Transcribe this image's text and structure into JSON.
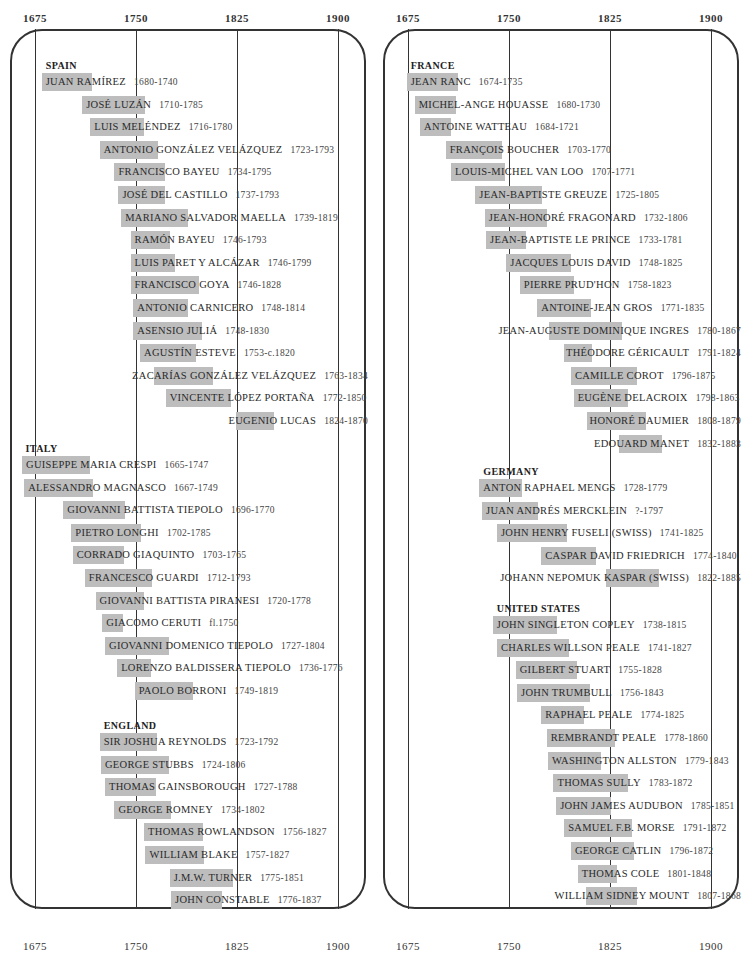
{
  "axis": {
    "ticks": [
      1675,
      1750,
      1825,
      1900
    ]
  },
  "colors": {
    "bar": "#bdbdbd",
    "frame": "#333333",
    "text": "#2a2a2a"
  },
  "chart_data": {
    "type": "timeline",
    "title": "",
    "xlabel": "Year",
    "xlim": [
      1675,
      1900
    ],
    "xticks": [
      1675,
      1750,
      1825,
      1900
    ],
    "grid": true,
    "panels": [
      {
        "groups": [
          {
            "country": "SPAIN",
            "artists": [
              {
                "name": "JUAN RAMÍREZ",
                "dates": "1680-1740",
                "start": 1680,
                "end": 1740
              },
              {
                "name": "JOSÉ LUZÁN",
                "dates": "1710-1785",
                "start": 1710,
                "end": 1785
              },
              {
                "name": "LUIS MELÉNDEZ",
                "dates": "1716-1780",
                "start": 1716,
                "end": 1780
              },
              {
                "name": "ANTONIO GONZÁLEZ VELÁZQUEZ",
                "dates": "1723-1793",
                "start": 1723,
                "end": 1793
              },
              {
                "name": "FRANCISCO BAYEU",
                "dates": "1734-1795",
                "start": 1734,
                "end": 1795
              },
              {
                "name": "JOSÉ DEL CASTILLO",
                "dates": "1737-1793",
                "start": 1737,
                "end": 1793
              },
              {
                "name": "MARIANO SALVADOR MAELLA",
                "dates": "1739-1819",
                "start": 1739,
                "end": 1819
              },
              {
                "name": "RAMÓN BAYEU",
                "dates": "1746-1793",
                "start": 1746,
                "end": 1793
              },
              {
                "name": "LUIS PARET Y ALCÁZAR",
                "dates": "1746-1799",
                "start": 1746,
                "end": 1799
              },
              {
                "name": "FRANCISCO GOYA",
                "dates": "1746-1828",
                "start": 1746,
                "end": 1828
              },
              {
                "name": "ANTONIO CARNICERO",
                "dates": "1748-1814",
                "start": 1748,
                "end": 1814
              },
              {
                "name": "ASENSIO JULIÁ",
                "dates": "1748-1830",
                "start": 1748,
                "end": 1830
              },
              {
                "name": "AGUSTÍN ESTEVE",
                "dates": "1753-c.1820",
                "start": 1753,
                "end": 1820
              },
              {
                "name": "ZACARÍAS GONZÁLEZ VELÁZQUEZ",
                "dates": "1763-1834",
                "start": 1763,
                "end": 1834
              },
              {
                "name": "VINCENTE LÓPEZ PORTAÑA",
                "dates": "1772-1850",
                "start": 1772,
                "end": 1850
              },
              {
                "name": "EUGENIO LUCAS",
                "dates": "1824-1870",
                "start": 1824,
                "end": 1870
              }
            ]
          },
          {
            "country": "ITALY",
            "artists": [
              {
                "name": "GUISEPPE MARIA CRESPI",
                "dates": "1665-1747",
                "start": 1665,
                "end": 1747
              },
              {
                "name": "ALESSANDRO MAGNASCO",
                "dates": "1667-1749",
                "start": 1667,
                "end": 1749
              },
              {
                "name": "GIOVANNI BATTISTA TIEPOLO",
                "dates": "1696-1770",
                "start": 1696,
                "end": 1770
              },
              {
                "name": "PIETRO LONGHI",
                "dates": "1702-1785",
                "start": 1702,
                "end": 1785
              },
              {
                "name": "CORRADO GIAQUINTO",
                "dates": "1703-1765",
                "start": 1703,
                "end": 1765
              },
              {
                "name": "FRANCESCO GUARDI",
                "dates": "1712-1793",
                "start": 1712,
                "end": 1793
              },
              {
                "name": "GIOVANNI BATTISTA PIRANESI",
                "dates": "1720-1778",
                "start": 1720,
                "end": 1778
              },
              {
                "name": "GIACOMO CERUTI",
                "dates": "fl.1750",
                "start": 1725,
                "end": 1750
              },
              {
                "name": "GIOVANNI DOMENICO TIEPOLO",
                "dates": "1727-1804",
                "start": 1727,
                "end": 1804
              },
              {
                "name": "LORENZO BALDISSERA TIEPOLO",
                "dates": "1736-1776",
                "start": 1736,
                "end": 1776
              },
              {
                "name": "PAOLO BORRONI",
                "dates": "1749-1819",
                "start": 1749,
                "end": 1819
              }
            ]
          },
          {
            "country": "ENGLAND",
            "artists": [
              {
                "name": "SIR JOSHUA REYNOLDS",
                "dates": "1723-1792",
                "start": 1723,
                "end": 1792
              },
              {
                "name": "GEORGE STUBBS",
                "dates": "1724-1806",
                "start": 1724,
                "end": 1806
              },
              {
                "name": "THOMAS GAINSBOROUGH",
                "dates": "1727-1788",
                "start": 1727,
                "end": 1788
              },
              {
                "name": "GEORGE ROMNEY",
                "dates": "1734-1802",
                "start": 1734,
                "end": 1802
              },
              {
                "name": "THOMAS ROWLANDSON",
                "dates": "1756-1827",
                "start": 1756,
                "end": 1827
              },
              {
                "name": "WILLIAM BLAKE",
                "dates": "1757-1827",
                "start": 1757,
                "end": 1827
              },
              {
                "name": "J.M.W. TURNER",
                "dates": "1775-1851",
                "start": 1775,
                "end": 1851
              },
              {
                "name": "JOHN CONSTABLE",
                "dates": "1776-1837",
                "start": 1776,
                "end": 1837
              }
            ]
          }
        ]
      },
      {
        "groups": [
          {
            "country": "FRANCE",
            "artists": [
              {
                "name": "JEAN RANC",
                "dates": "1674-1735",
                "start": 1674,
                "end": 1735
              },
              {
                "name": "MICHEL-ANGE HOUASSE",
                "dates": "1680-1730",
                "start": 1680,
                "end": 1730
              },
              {
                "name": "ANTOINE WATTEAU",
                "dates": "1684-1721",
                "start": 1684,
                "end": 1721
              },
              {
                "name": "FRANÇOIS BOUCHER",
                "dates": "1703-1770",
                "start": 1703,
                "end": 1770
              },
              {
                "name": "LOUIS-MICHEL VAN LOO",
                "dates": "1707-1771",
                "start": 1707,
                "end": 1771
              },
              {
                "name": "JEAN-BAPTISTE GREUZE",
                "dates": "1725-1805",
                "start": 1725,
                "end": 1805
              },
              {
                "name": "JEAN-HONORÉ FRAGONARD",
                "dates": "1732-1806",
                "start": 1732,
                "end": 1806
              },
              {
                "name": "JEAN-BAPTISTE LE PRINCE",
                "dates": "1733-1781",
                "start": 1733,
                "end": 1781
              },
              {
                "name": "JACQUES LOUIS DAVID",
                "dates": "1748-1825",
                "start": 1748,
                "end": 1825
              },
              {
                "name": "PIERRE PRUD'HON",
                "dates": "1758-1823",
                "start": 1758,
                "end": 1823
              },
              {
                "name": "ANTOINE-JEAN GROS",
                "dates": "1771-1835",
                "start": 1771,
                "end": 1835
              },
              {
                "name": "JEAN-AUGUSTE DOMINIQUE INGRES",
                "dates": "1780-1867",
                "start": 1780,
                "end": 1867
              },
              {
                "name": "THÉODORE GÉRICAULT",
                "dates": "1791-1824",
                "start": 1791,
                "end": 1824
              },
              {
                "name": "CAMILLE COROT",
                "dates": "1796-1875",
                "start": 1796,
                "end": 1875
              },
              {
                "name": "EUGÈNE DELACROIX",
                "dates": "1798-1863",
                "start": 1798,
                "end": 1863
              },
              {
                "name": "HONORÉ DAUMIER",
                "dates": "1808-1879",
                "start": 1808,
                "end": 1879
              },
              {
                "name": "EDOUARD MANET",
                "dates": "1832-1883",
                "start": 1832,
                "end": 1883
              }
            ]
          },
          {
            "country": "GERMANY",
            "artists": [
              {
                "name": "ANTON RAPHAEL MENGS",
                "dates": "1728-1779",
                "start": 1728,
                "end": 1779
              },
              {
                "name": "JUAN ANDRÉS MERCKLEIN",
                "dates": "?-1797",
                "start": 1730,
                "end": 1797
              },
              {
                "name": "JOHN HENRY FUSELI (SWISS)",
                "dates": "1741-1825",
                "start": 1741,
                "end": 1825
              },
              {
                "name": "CASPAR DAVID FRIEDRICH",
                "dates": "1774-1840",
                "start": 1774,
                "end": 1840
              },
              {
                "name": "JOHANN NEPOMUK KASPAR (SWISS)",
                "dates": "1822-1885",
                "start": 1822,
                "end": 1885
              }
            ]
          },
          {
            "country": "UNITED STATES",
            "artists": [
              {
                "name": "JOHN SINGLETON COPLEY",
                "dates": "1738-1815",
                "start": 1738,
                "end": 1815
              },
              {
                "name": "CHARLES WILLSON PEALE",
                "dates": "1741-1827",
                "start": 1741,
                "end": 1827
              },
              {
                "name": "GILBERT STUART",
                "dates": "1755-1828",
                "start": 1755,
                "end": 1828
              },
              {
                "name": "JOHN TRUMBULL",
                "dates": "1756-1843",
                "start": 1756,
                "end": 1843
              },
              {
                "name": "RAPHAEL PEALE",
                "dates": "1774-1825",
                "start": 1774,
                "end": 1825
              },
              {
                "name": "REMBRANDT PEALE",
                "dates": "1778-1860",
                "start": 1778,
                "end": 1860
              },
              {
                "name": "WASHINGTON ALLSTON",
                "dates": "1779-1843",
                "start": 1779,
                "end": 1843
              },
              {
                "name": "THOMAS SULLY",
                "dates": "1783-1872",
                "start": 1783,
                "end": 1872
              },
              {
                "name": "JOHN JAMES AUDUBON",
                "dates": "1785-1851",
                "start": 1785,
                "end": 1851
              },
              {
                "name": "SAMUEL F.B. MORSE",
                "dates": "1791-1872",
                "start": 1791,
                "end": 1872
              },
              {
                "name": "GEORGE CATLIN",
                "dates": "1796-1872",
                "start": 1796,
                "end": 1872
              },
              {
                "name": "THOMAS COLE",
                "dates": "1801-1848",
                "start": 1801,
                "end": 1848
              },
              {
                "name": "WILLIAM SIDNEY MOUNT",
                "dates": "1807-1868",
                "start": 1807,
                "end": 1868
              }
            ]
          }
        ]
      }
    ]
  }
}
